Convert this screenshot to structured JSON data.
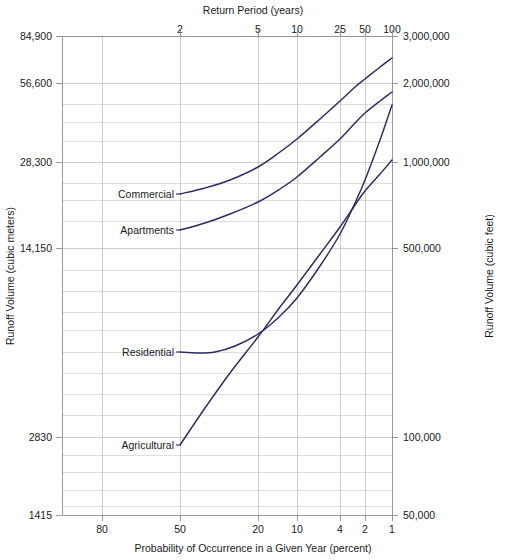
{
  "chart_data": {
    "type": "line",
    "title": "",
    "xlabel": "Probability of Occurrence in a Given Year (percent)",
    "xlabel_top": "Return Period (years)",
    "ylabel": "Runoff Volume (cubic meters)",
    "ylabel_right": "Runoff Volume (cubic feet)",
    "grid": true,
    "legend": "inline-labels",
    "x_axis": {
      "scale": "probability-log",
      "tick_labels": [
        "80",
        "50",
        "20",
        "10",
        "4",
        "2",
        "1"
      ],
      "tick_values": [
        80,
        50,
        20,
        10,
        4,
        2,
        1
      ],
      "tick_positions": [
        102,
        180,
        258,
        297,
        340,
        365,
        392
      ]
    },
    "x_axis_top": {
      "label": "Return Period (years)",
      "tick_labels": [
        "2",
        "5",
        "10",
        "25",
        "50",
        "100"
      ],
      "tick_values": [
        2,
        5,
        10,
        25,
        50,
        100
      ],
      "tick_positions": [
        180,
        258,
        297,
        340,
        365,
        392
      ]
    },
    "y_axis_left": {
      "scale": "log",
      "units": "cubic meters",
      "tick_labels": [
        "84,900",
        "56,600",
        "28,300",
        "14,150",
        "2830",
        "1415"
      ],
      "tick_values": [
        84900,
        56600,
        28300,
        14150,
        2830,
        1415
      ],
      "tick_positions": [
        36,
        83,
        162,
        248,
        437,
        515
      ],
      "ylim": [
        1415,
        84900
      ]
    },
    "y_axis_right": {
      "scale": "log",
      "units": "cubic feet",
      "tick_labels": [
        "3,000,000",
        "2,000,000",
        "1,000,000",
        "500,000",
        "100,000",
        "50,000"
      ],
      "tick_values": [
        3000000,
        2000000,
        1000000,
        500000,
        100000,
        50000
      ],
      "tick_positions": [
        36,
        83,
        162,
        248,
        437,
        515
      ],
      "ylim": [
        50000,
        3000000
      ]
    },
    "minor_y_gridlines": [
      36,
      83,
      104,
      122,
      141,
      162,
      183,
      200,
      221,
      248,
      270,
      291,
      312,
      330,
      352,
      373,
      394,
      415,
      437,
      455,
      472,
      490,
      506,
      515
    ],
    "series": [
      {
        "name": "Commercial",
        "color": "#2b2b63",
        "label_position": {
          "x": 122,
          "y": 197
        },
        "leader_to": {
          "x": 180,
          "y": 194
        },
        "points": [
          {
            "x": 180,
            "y": 194
          },
          {
            "x": 205,
            "y": 188
          },
          {
            "x": 230,
            "y": 180
          },
          {
            "x": 258,
            "y": 167
          },
          {
            "x": 280,
            "y": 152
          },
          {
            "x": 297,
            "y": 139
          },
          {
            "x": 320,
            "y": 119
          },
          {
            "x": 340,
            "y": 101
          },
          {
            "x": 355,
            "y": 87
          },
          {
            "x": 365,
            "y": 79
          },
          {
            "x": 380,
            "y": 67
          },
          {
            "x": 392,
            "y": 58
          }
        ]
      },
      {
        "name": "Apartments",
        "color": "#2b2b63",
        "label_position": {
          "x": 122,
          "y": 233
        },
        "leader_to": {
          "x": 180,
          "y": 230
        },
        "points": [
          {
            "x": 180,
            "y": 230
          },
          {
            "x": 205,
            "y": 223
          },
          {
            "x": 230,
            "y": 214
          },
          {
            "x": 258,
            "y": 202
          },
          {
            "x": 280,
            "y": 189
          },
          {
            "x": 297,
            "y": 177
          },
          {
            "x": 320,
            "y": 157
          },
          {
            "x": 340,
            "y": 139
          },
          {
            "x": 355,
            "y": 123
          },
          {
            "x": 365,
            "y": 113
          },
          {
            "x": 380,
            "y": 101
          },
          {
            "x": 392,
            "y": 92
          }
        ]
      },
      {
        "name": "Residential",
        "color": "#2b2b63",
        "label_position": {
          "x": 122,
          "y": 354
        },
        "leader_to": {
          "x": 180,
          "y": 352
        },
        "points": [
          {
            "x": 180,
            "y": 352
          },
          {
            "x": 198,
            "y": 353
          },
          {
            "x": 215,
            "y": 352
          },
          {
            "x": 235,
            "y": 346
          },
          {
            "x": 258,
            "y": 334
          },
          {
            "x": 278,
            "y": 318
          },
          {
            "x": 297,
            "y": 298
          },
          {
            "x": 320,
            "y": 266
          },
          {
            "x": 340,
            "y": 234
          },
          {
            "x": 355,
            "y": 203
          },
          {
            "x": 365,
            "y": 180
          },
          {
            "x": 380,
            "y": 140
          },
          {
            "x": 392,
            "y": 105
          }
        ]
      },
      {
        "name": "Agricultural",
        "color": "#2b2b63",
        "label_position": {
          "x": 122,
          "y": 447
        },
        "leader_to": {
          "x": 180,
          "y": 445
        },
        "points": [
          {
            "x": 180,
            "y": 445
          },
          {
            "x": 205,
            "y": 408
          },
          {
            "x": 230,
            "y": 373
          },
          {
            "x": 258,
            "y": 337
          },
          {
            "x": 280,
            "y": 307
          },
          {
            "x": 297,
            "y": 285
          },
          {
            "x": 320,
            "y": 254
          },
          {
            "x": 340,
            "y": 227
          },
          {
            "x": 355,
            "y": 205
          },
          {
            "x": 365,
            "y": 191
          },
          {
            "x": 380,
            "y": 174
          },
          {
            "x": 392,
            "y": 160
          }
        ]
      }
    ]
  },
  "plot_area": {
    "left": 62,
    "right": 392,
    "top": 36,
    "bottom": 515
  }
}
